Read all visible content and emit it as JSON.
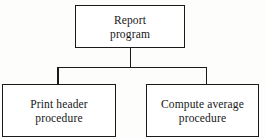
{
  "diagram": {
    "type": "hierarchy-structure-chart",
    "orientation": "top-down",
    "background_color": "#fdfdfc",
    "line_color": "#1a1a1a",
    "box_fill_color": "#ffffff",
    "text_color": "#161616",
    "nodes": [
      {
        "id": "root",
        "label": "Report\nprogram",
        "line1": "Report",
        "line2": "program",
        "level": 0
      },
      {
        "id": "print-header",
        "label": "Print header\nprocedure",
        "line1": "Print header",
        "line2": "procedure",
        "level": 1
      },
      {
        "id": "compute-average",
        "label": "Compute average\nprocedure",
        "line1": "Compute average",
        "line2": "procedure",
        "level": 1
      }
    ],
    "edges": [
      {
        "from": "root",
        "to": "print-header"
      },
      {
        "from": "root",
        "to": "compute-average"
      }
    ]
  }
}
